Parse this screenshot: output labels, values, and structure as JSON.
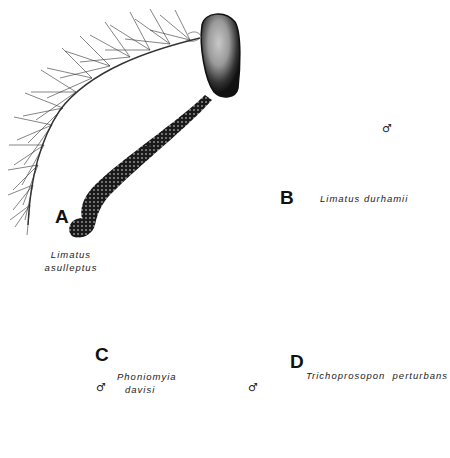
{
  "figure": {
    "colors": {
      "ink": "#111111",
      "paper": "#ffffff",
      "scape_highlight": "#cfcfcf"
    },
    "panels": [
      {
        "letter": "A",
        "species_line1": "Limatus",
        "species_line2": "asulleptus",
        "sex_symbol": "♂"
      },
      {
        "letter": "B",
        "species_line1": "Limatus durhamii",
        "species_line2": "",
        "sex_symbol": "♂"
      },
      {
        "letter": "C",
        "species_line1": "Phoniomyia",
        "species_line2": "davisi",
        "sex_symbol": "♂"
      },
      {
        "letter": "D",
        "species_line1": "Trichoprosopon  perturbans",
        "species_line2": "",
        "sex_symbol": "♂"
      }
    ]
  }
}
